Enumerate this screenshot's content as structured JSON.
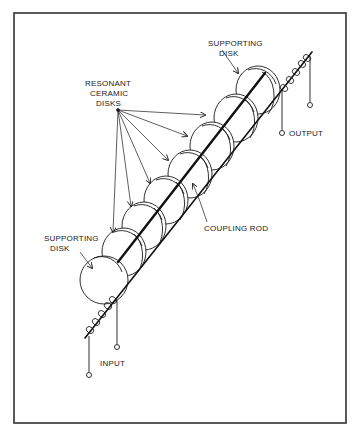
{
  "diagram": {
    "type": "mechanical-filter-illustration",
    "frame": {
      "x": 14,
      "y": 13,
      "width": 332,
      "height": 410,
      "stroke": "#333333"
    },
    "colors": {
      "ink": "#1a1a1a",
      "background": "#ffffff"
    },
    "labels": {
      "supporting_disk_top_line1": "SUPPORTING",
      "supporting_disk_top_line2": "DISK",
      "resonant_line1": "RESONANT",
      "resonant_line2": "CERAMIC",
      "resonant_line3": "DISKS",
      "output": "OUTPUT",
      "coupling_rod": "COUPLING ROD",
      "supporting_disk_bottom_line1": "SUPPORTING",
      "supporting_disk_bottom_line2": "DISK",
      "input": "INPUT"
    },
    "components": [
      {
        "name": "supporting-disk-top",
        "role": "supporting disk"
      },
      {
        "name": "resonant-disk",
        "count": 6
      },
      {
        "name": "supporting-disk-bottom",
        "role": "supporting disk"
      },
      {
        "name": "coupling-rod"
      },
      {
        "name": "output-transducer-coil",
        "terminals": 2
      },
      {
        "name": "input-transducer-coil",
        "terminals": 2
      }
    ]
  }
}
